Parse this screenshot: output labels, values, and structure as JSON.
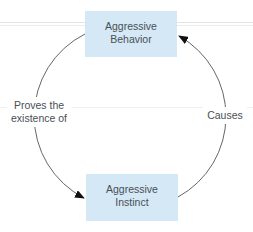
{
  "diagram": {
    "type": "cycle",
    "nodes": [
      {
        "id": "behavior",
        "label_line1": "Aggressive",
        "label_line2": "Behavior"
      },
      {
        "id": "instinct",
        "label_line1": "Aggressive",
        "label_line2": "Instinct"
      }
    ],
    "edges": [
      {
        "from": "behavior",
        "to": "instinct",
        "side": "left",
        "label_line1": "Proves the",
        "label_line2": "existence of"
      },
      {
        "from": "instinct",
        "to": "behavior",
        "side": "right",
        "label_line1": "Causes",
        "label_line2": ""
      }
    ],
    "colors": {
      "box_fill": "#d4e8f6",
      "text": "#4a4f55",
      "arc": "#555555"
    }
  }
}
